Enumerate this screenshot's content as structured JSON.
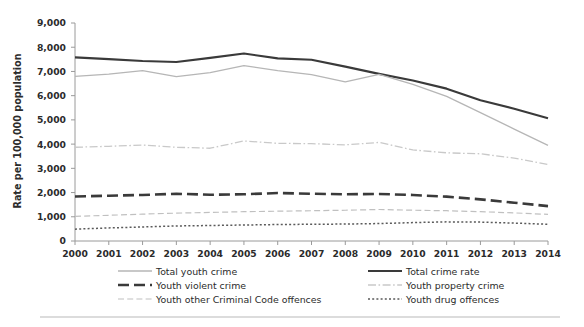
{
  "chart_data": {
    "type": "line",
    "title": "",
    "xlabel": "",
    "ylabel": "Rate per 100,000 population",
    "x": [
      2000,
      2001,
      2002,
      2003,
      2004,
      2005,
      2006,
      2007,
      2008,
      2009,
      2010,
      2011,
      2012,
      2013,
      2014
    ],
    "xlim": [
      2000,
      2014
    ],
    "ylim": [
      0,
      9000
    ],
    "ytick_values": [
      0,
      1000,
      2000,
      3000,
      4000,
      5000,
      6000,
      7000,
      8000,
      9000
    ],
    "ytick_labels": [
      "0",
      "1,000",
      "2,000",
      "3,000",
      "4,000",
      "5,000",
      "6,000",
      "7,000",
      "8,000",
      "9,000"
    ],
    "xtick_labels": [
      "2000",
      "2001",
      "2002",
      "2003",
      "2004",
      "2005",
      "2006",
      "2007",
      "2008",
      "2009",
      "2010",
      "2011",
      "2012",
      "2013",
      "2014"
    ],
    "grid": false,
    "legend_position": "bottom",
    "series": [
      {
        "name": "Total crime rate",
        "style": "solid",
        "color": "#3a3a3a",
        "width": 2.1,
        "dash": "",
        "values": [
          7580,
          7510,
          7430,
          7390,
          7560,
          7740,
          7540,
          7480,
          7200,
          6900,
          6630,
          6290,
          5810,
          5460,
          5070
        ]
      },
      {
        "name": "Total youth crime",
        "style": "solid",
        "color": "#b6b6b6",
        "width": 1.3,
        "dash": "",
        "values": [
          6800,
          6890,
          7030,
          6790,
          6950,
          7240,
          7030,
          6870,
          6570,
          6880,
          6470,
          5970,
          5300,
          4620,
          3950
        ]
      },
      {
        "name": "Youth property crime",
        "style": "dashdot",
        "color": "#c9c9c9",
        "width": 1.3,
        "dash": "8,2.5,1.6,2.5",
        "values": [
          3870,
          3910,
          3960,
          3870,
          3830,
          4130,
          4030,
          4020,
          3970,
          4070,
          3760,
          3640,
          3600,
          3420,
          3160
        ]
      },
      {
        "name": "Youth violent crime",
        "style": "dashed-heavy",
        "color": "#3a3a3a",
        "width": 2.6,
        "dash": "11,5",
        "values": [
          1840,
          1870,
          1900,
          1950,
          1910,
          1930,
          1980,
          1950,
          1930,
          1940,
          1900,
          1830,
          1720,
          1580,
          1440
        ]
      },
      {
        "name": "Youth other Criminal Code offences",
        "style": "dashed-light",
        "color": "#c0c0c0",
        "width": 1.2,
        "dash": "6,3.2",
        "values": [
          1020,
          1060,
          1110,
          1150,
          1180,
          1210,
          1230,
          1250,
          1270,
          1300,
          1270,
          1250,
          1210,
          1160,
          1100
        ]
      },
      {
        "name": "Youth drug offences",
        "style": "dotted",
        "color": "#5a5a5a",
        "width": 1.5,
        "dash": "2,2.2",
        "values": [
          490,
          540,
          580,
          620,
          640,
          660,
          680,
          690,
          700,
          720,
          760,
          790,
          780,
          740,
          690
        ]
      }
    ],
    "legend": [
      {
        "label": "Total youth crime",
        "series": "Total youth crime",
        "column": 0,
        "row": 0
      },
      {
        "label": "Youth violent crime",
        "series": "Youth violent crime",
        "column": 0,
        "row": 1
      },
      {
        "label": "Youth other Criminal Code offences",
        "series": "Youth other Criminal Code offences",
        "column": 0,
        "row": 2
      },
      {
        "label": "Total crime rate",
        "series": "Total crime rate",
        "column": 1,
        "row": 0
      },
      {
        "label": "Youth property crime",
        "series": "Youth property crime",
        "column": 1,
        "row": 1
      },
      {
        "label": "Youth drug offences",
        "series": "Youth drug offences",
        "column": 1,
        "row": 2
      }
    ]
  }
}
